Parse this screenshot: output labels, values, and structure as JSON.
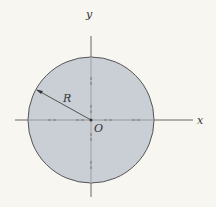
{
  "diagram": {
    "shape": "circle",
    "fill_color": "#c9cfd4",
    "stroke_color": "#555555",
    "labels": {
      "x_axis": "x",
      "y_axis": "y",
      "origin": "O",
      "radius": "R"
    }
  }
}
